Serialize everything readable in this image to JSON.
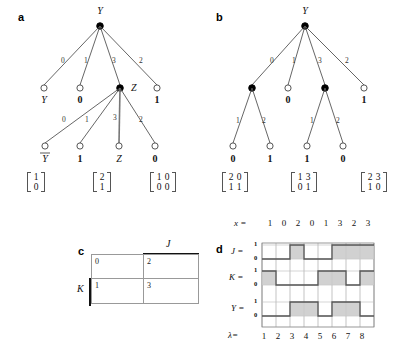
{
  "figure": {
    "panels": [
      "a",
      "b",
      "c",
      "d"
    ]
  },
  "panel_a": {
    "letter": "a",
    "root": {
      "name": "Y",
      "style": "filled"
    },
    "level1": {
      "edge_labels": [
        "0",
        "1",
        "3",
        "2"
      ],
      "nodes": [
        {
          "style": "open",
          "label": "Y",
          "label_kind": "var"
        },
        {
          "style": "open",
          "label": "0",
          "label_kind": "val"
        },
        {
          "style": "filled",
          "label": "Z",
          "label_kind": "name"
        },
        {
          "style": "open",
          "label": "1",
          "label_kind": "val"
        }
      ]
    },
    "level2": {
      "edge_labels": [
        "0",
        "1",
        "3",
        "2"
      ],
      "nodes": [
        {
          "style": "open",
          "label": "Y",
          "label_kind": "var",
          "overline": true
        },
        {
          "style": "open",
          "label": "1",
          "label_kind": "val"
        },
        {
          "style": "open",
          "label": "Z",
          "label_kind": "var"
        },
        {
          "style": "open",
          "label": "0",
          "label_kind": "val"
        }
      ]
    },
    "matrices": [
      {
        "rows": [
          [
            "1"
          ],
          [
            "0"
          ]
        ]
      },
      {
        "rows": [
          [
            "2"
          ],
          [
            "1"
          ]
        ]
      },
      {
        "rows": [
          [
            "1",
            "0"
          ],
          [
            "0",
            "0"
          ]
        ]
      }
    ]
  },
  "panel_b": {
    "letter": "b",
    "root": {
      "name": "Y",
      "style": "filled"
    },
    "level1": {
      "edge_labels": [
        "0",
        "1",
        "3",
        "2"
      ],
      "nodes": [
        {
          "style": "filled",
          "label": "",
          "label_kind": "none"
        },
        {
          "style": "open",
          "label": "0",
          "label_kind": "val"
        },
        {
          "style": "filled",
          "label": "",
          "label_kind": "none"
        },
        {
          "style": "open",
          "label": "1",
          "label_kind": "val"
        }
      ]
    },
    "subtree_left": {
      "edge_labels": [
        "1",
        "2"
      ],
      "leaves": [
        "0",
        "1"
      ]
    },
    "subtree_right": {
      "edge_labels": [
        "1",
        "2"
      ],
      "leaves": [
        "1",
        "0"
      ]
    },
    "matrices": [
      {
        "rows": [
          [
            "2",
            "0"
          ],
          [
            "1",
            "1"
          ]
        ]
      },
      {
        "rows": [
          [
            "1",
            "3"
          ],
          [
            "0",
            "1"
          ]
        ]
      },
      {
        "rows": [
          [
            "2",
            "3"
          ],
          [
            "1",
            "0"
          ]
        ]
      }
    ]
  },
  "panel_c": {
    "letter": "c",
    "col_label": "J",
    "row_label": "K",
    "cells": [
      [
        "0",
        "2"
      ],
      [
        "1",
        "3"
      ]
    ]
  },
  "panel_d": {
    "letter": "d",
    "x_label": "x =",
    "x_values": [
      "1",
      "0",
      "2",
      "0",
      "1",
      "3",
      "2",
      "3"
    ],
    "lambda_label": "λ=",
    "lambda_values": [
      "1",
      "2",
      "3",
      "4",
      "5",
      "6",
      "7",
      "8"
    ],
    "signals": [
      {
        "name": "J =",
        "high_label": "1",
        "low_label": "0",
        "values": [
          0,
          0,
          1,
          0,
          0,
          1,
          1,
          1
        ]
      },
      {
        "name": "K =",
        "high_label": "1",
        "low_label": "0",
        "values": [
          1,
          0,
          0,
          0,
          1,
          1,
          0,
          1
        ]
      },
      {
        "name": "Y =",
        "high_label": "1",
        "low_label": "0",
        "values": [
          0,
          0,
          1,
          1,
          0,
          1,
          1,
          0
        ]
      }
    ]
  },
  "chart_data": {
    "type": "table",
    "title": "",
    "timing_diagram": {
      "x": [
        "1",
        "0",
        "2",
        "0",
        "1",
        "3",
        "2",
        "3"
      ],
      "lambda": [
        1,
        2,
        3,
        4,
        5,
        6,
        7,
        8
      ],
      "series": [
        {
          "name": "J",
          "values": [
            0,
            0,
            1,
            0,
            0,
            1,
            1,
            1
          ]
        },
        {
          "name": "K",
          "values": [
            1,
            0,
            0,
            0,
            1,
            1,
            0,
            1
          ]
        },
        {
          "name": "Y",
          "values": [
            0,
            0,
            1,
            1,
            0,
            1,
            1,
            0
          ]
        }
      ],
      "ylim": [
        0,
        1
      ],
      "grid": true
    },
    "karnaugh": {
      "col_label": "J",
      "row_label": "K",
      "values": [
        [
          0,
          2
        ],
        [
          1,
          3
        ]
      ]
    }
  },
  "colors": {
    "wave_fill": "#c9c9c9",
    "wave_stroke": "#555555",
    "grid": "#9a9a9a",
    "node_stroke": "#444444",
    "text": "#111111"
  }
}
